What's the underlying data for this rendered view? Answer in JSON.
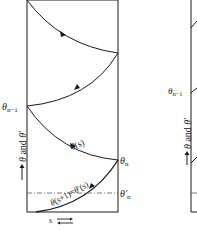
{
  "left_panel": {
    "y_axis_label": "→ θ and θ′",
    "x_axis_label": "s",
    "labels": {
      "theta_n_minus_1": "θn−1",
      "theta_n": "θn",
      "theta_n_prime": "θ′n",
      "curve_theta_s": "θ(s)",
      "curve_theta_s_plus_1": "θ(s+1)=θ′(s)"
    }
  },
  "right_panel": {
    "y_axis_label": "→ θ and θ′",
    "labels": {
      "theta_n_minus_1": "θn−1"
    }
  },
  "colors": {
    "ink": "#1a1a1a",
    "background": "#ffffff"
  }
}
